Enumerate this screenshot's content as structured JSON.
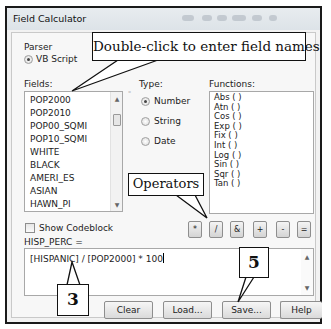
{
  "window": {
    "title": "Field Calculator"
  },
  "parser": {
    "label": "Parser",
    "selected": "VB Script"
  },
  "fields": {
    "label": "Fields:",
    "items": [
      "POP2000",
      "POP2010",
      "POP00_SQMI",
      "POP10_SQMI",
      "WHITE",
      "BLACK",
      "AMERI_ES",
      "ASIAN",
      "HAWN_PI"
    ]
  },
  "type": {
    "label": "Type:",
    "options": [
      "Number",
      "String",
      "Date"
    ],
    "selected": "Number"
  },
  "functions": {
    "label": "Functions:",
    "items": [
      "Abs ( )",
      "Atn ( )",
      "Cos ( )",
      "Exp ( )",
      "Fix ( )",
      "Int ( )",
      "Log ( )",
      "Sin ( )",
      "Sqr ( )",
      "Tan ( )"
    ]
  },
  "show_codeblock": {
    "label": "Show Codeblock",
    "checked": false
  },
  "operators": [
    "*",
    "/",
    "&",
    "+",
    "-",
    "="
  ],
  "expression": {
    "label": "HISP_PERC =",
    "value": "[HISPANIC] / [POP2000] * 100"
  },
  "buttons": {
    "clear": "Clear",
    "load": "Load...",
    "save": "Save...",
    "help": "Help"
  },
  "annotations": {
    "fields_hint": "Double-click to enter field names",
    "operators_hint": "Operators",
    "step_3": "3",
    "step_5": "5"
  }
}
